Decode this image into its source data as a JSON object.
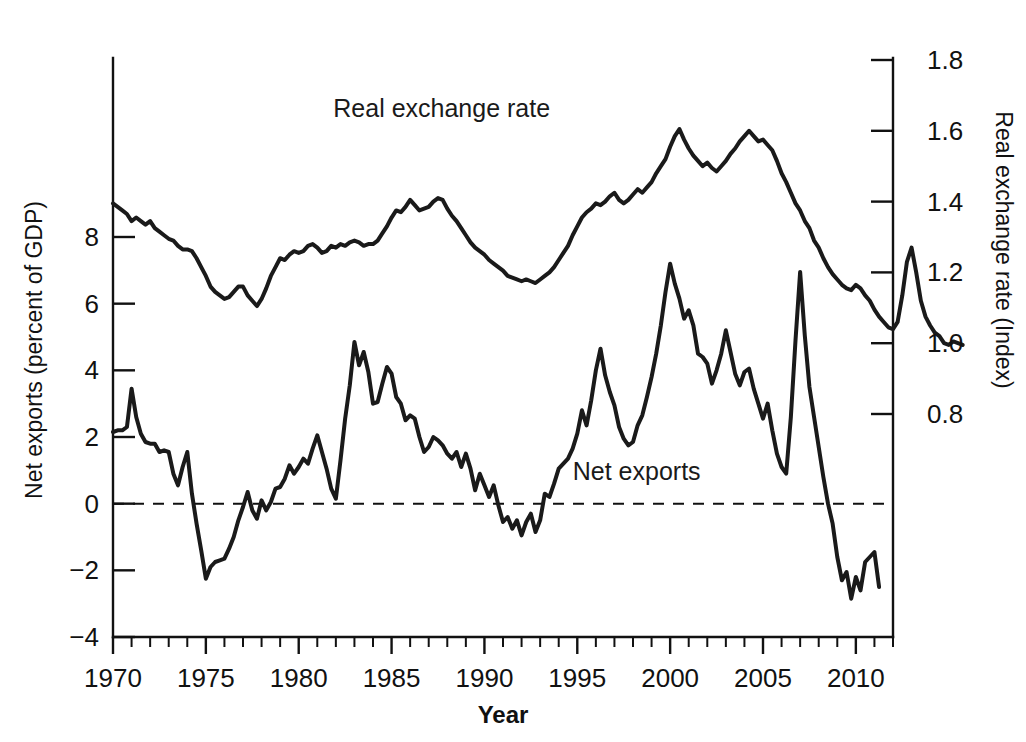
{
  "figure": {
    "background_color": "#ffffff",
    "line_color": "#1a1a1a",
    "axis_color": "#111111"
  },
  "labels": {
    "xlabel": "Year",
    "ylabel_left": "Net exports (percent of GDP)",
    "ylabel_right": "Real exchange rate (Index)",
    "series_label_rer": "Real exchange rate",
    "series_label_nx": "Net exports"
  },
  "axes": {
    "x_ticks_major": [
      "1970",
      "1975",
      "1980",
      "1985",
      "1990",
      "1995",
      "2000",
      "2005",
      "2010"
    ],
    "y_ticks_left": [
      "8",
      "6",
      "4",
      "2",
      "0",
      "−2",
      "−4"
    ],
    "y_ticks_right": [
      "1.8",
      "1.6",
      "1.4",
      "1.2",
      "1.0",
      "0.8"
    ],
    "x_minor_interval_years": 1,
    "grid": "off",
    "legend_position": "inline-annotation"
  },
  "chart_data": {
    "type": "line",
    "title": "",
    "subtitle": "",
    "xlabel": "Year",
    "ylabel": "Net exports (percent of GDP)",
    "ylabel_secondary": "Real exchange rate (Index)",
    "xlim": [
      1970,
      2012
    ],
    "ylim": [
      -4,
      9.8
    ],
    "ylim_secondary": [
      0.6506,
      1.0
    ],
    "x_tick_labels": [
      "1970",
      "1975",
      "1980",
      "1985",
      "1990",
      "1995",
      "2000",
      "2005",
      "2010"
    ],
    "y_tick_values_left": [
      8,
      6,
      4,
      2,
      0,
      -2,
      -4
    ],
    "y_tick_values_right": [
      1.8,
      1.6,
      1.4,
      1.2,
      1.0,
      0.8
    ],
    "grid": false,
    "legend_position": "inline",
    "annotations": [
      {
        "text": "Real exchange rate",
        "x": 1987.7,
        "y_axis": "right",
        "y": 1.64
      },
      {
        "text": "Net exports",
        "x": 1998.2,
        "y_axis": "left",
        "y": 0.72
      }
    ],
    "x_start": 1970.0,
    "x_step": 0.25,
    "series": [
      {
        "name": "Net exports",
        "axis": "left",
        "units": "percent of GDP",
        "values": [
          2.15,
          2.2,
          2.2,
          2.3,
          3.45,
          2.6,
          2.1,
          1.85,
          1.8,
          1.8,
          1.55,
          1.6,
          1.55,
          0.9,
          0.55,
          1.1,
          1.55,
          0.3,
          -0.6,
          -1.4,
          -2.25,
          -1.9,
          -1.75,
          -1.7,
          -1.65,
          -1.35,
          -1.0,
          -0.5,
          -0.1,
          0.35,
          -0.2,
          -0.45,
          0.1,
          -0.2,
          0.05,
          0.45,
          0.5,
          0.75,
          1.15,
          0.9,
          1.1,
          1.35,
          1.2,
          1.65,
          2.05,
          1.55,
          1.05,
          0.45,
          0.15,
          1.3,
          2.55,
          3.55,
          4.85,
          4.15,
          4.55,
          3.95,
          3.0,
          3.05,
          3.6,
          4.1,
          3.9,
          3.2,
          3.0,
          2.5,
          2.65,
          2.55,
          2.0,
          1.55,
          1.7,
          2.0,
          1.9,
          1.75,
          1.5,
          1.35,
          1.55,
          1.1,
          1.5,
          1.05,
          0.4,
          0.9,
          0.55,
          0.2,
          0.55,
          -0.05,
          -0.55,
          -0.4,
          -0.75,
          -0.5,
          -0.95,
          -0.55,
          -0.3,
          -0.85,
          -0.5,
          0.3,
          0.2,
          0.6,
          1.05,
          1.2,
          1.35,
          1.65,
          2.1,
          2.8,
          2.35,
          3.1,
          4.0,
          4.65,
          3.85,
          3.35,
          2.95,
          2.3,
          1.95,
          1.75,
          1.85,
          2.35,
          2.65,
          3.2,
          3.8,
          4.5,
          5.35,
          6.35,
          7.2,
          6.6,
          6.15,
          5.55,
          5.8,
          5.35,
          4.5,
          4.4,
          4.2,
          3.6,
          4.0,
          4.5,
          5.2,
          4.55,
          3.9,
          3.55,
          3.95,
          4.05,
          3.45,
          3.0,
          2.55,
          3.0,
          2.2,
          1.5,
          1.1,
          0.9,
          2.6,
          4.9,
          6.95,
          5.05,
          3.5,
          2.6,
          1.7,
          0.8,
          0.0,
          -0.6,
          -1.6,
          -2.3,
          -2.05,
          -2.85,
          -2.2,
          -2.6,
          -1.75,
          -1.6,
          -1.45,
          -2.5
        ]
      },
      {
        "name": "Real exchange rate",
        "axis": "right",
        "units": "index",
        "values": [
          1.395,
          1.385,
          1.375,
          1.365,
          1.345,
          1.355,
          1.345,
          1.335,
          1.345,
          1.325,
          1.315,
          1.305,
          1.295,
          1.29,
          1.275,
          1.265,
          1.265,
          1.26,
          1.24,
          1.215,
          1.19,
          1.16,
          1.145,
          1.135,
          1.125,
          1.13,
          1.145,
          1.16,
          1.16,
          1.135,
          1.12,
          1.105,
          1.125,
          1.155,
          1.19,
          1.215,
          1.24,
          1.235,
          1.25,
          1.26,
          1.255,
          1.26,
          1.275,
          1.28,
          1.27,
          1.255,
          1.26,
          1.275,
          1.27,
          1.28,
          1.275,
          1.285,
          1.29,
          1.285,
          1.275,
          1.28,
          1.28,
          1.29,
          1.31,
          1.33,
          1.355,
          1.375,
          1.37,
          1.385,
          1.405,
          1.39,
          1.375,
          1.38,
          1.385,
          1.4,
          1.41,
          1.405,
          1.38,
          1.36,
          1.345,
          1.325,
          1.305,
          1.285,
          1.27,
          1.26,
          1.25,
          1.235,
          1.225,
          1.215,
          1.205,
          1.19,
          1.185,
          1.18,
          1.175,
          1.18,
          1.175,
          1.17,
          1.18,
          1.19,
          1.2,
          1.215,
          1.235,
          1.255,
          1.275,
          1.305,
          1.33,
          1.355,
          1.37,
          1.38,
          1.395,
          1.39,
          1.4,
          1.415,
          1.425,
          1.405,
          1.395,
          1.405,
          1.42,
          1.435,
          1.425,
          1.44,
          1.455,
          1.48,
          1.5,
          1.52,
          1.555,
          1.585,
          1.605,
          1.575,
          1.55,
          1.53,
          1.515,
          1.5,
          1.51,
          1.495,
          1.485,
          1.5,
          1.515,
          1.535,
          1.55,
          1.57,
          1.585,
          1.6,
          1.585,
          1.57,
          1.575,
          1.56,
          1.545,
          1.515,
          1.48,
          1.455,
          1.425,
          1.395,
          1.375,
          1.345,
          1.325,
          1.29,
          1.27,
          1.24,
          1.215,
          1.195,
          1.18,
          1.165,
          1.155,
          1.15,
          1.165,
          1.155,
          1.135,
          1.12,
          1.095,
          1.075,
          1.06,
          1.045,
          1.04,
          1.06,
          1.135,
          1.23,
          1.27,
          1.2,
          1.12,
          1.075,
          1.05,
          1.03,
          1.02,
          1.0,
          0.995,
          1.005,
          1.0,
          0.995
        ]
      }
    ]
  }
}
